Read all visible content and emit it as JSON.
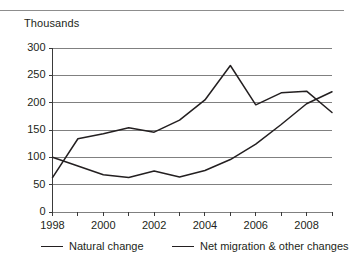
{
  "chart_data": {
    "type": "line",
    "title": "",
    "subtitle": "",
    "axis_note": "Thousands",
    "xlabel": "",
    "ylabel": "Thousands",
    "x": [
      1998,
      1999,
      2000,
      2001,
      2002,
      2003,
      2004,
      2005,
      2006,
      2007,
      2008,
      2009
    ],
    "xlim": [
      1998,
      2009
    ],
    "ylim": [
      0,
      300
    ],
    "ytick_labels": [
      "0",
      "50",
      "100",
      "150",
      "200",
      "250",
      "300"
    ],
    "ytick_values": [
      0,
      50,
      100,
      150,
      200,
      250,
      300
    ],
    "xtick_labels": [
      "1998",
      "2000",
      "2002",
      "2004",
      "2006",
      "2008"
    ],
    "xtick_values": [
      1998,
      2000,
      2002,
      2004,
      2006,
      2008
    ],
    "grid": "horizontal",
    "legend_position": "bottom",
    "line_color": "#231f20",
    "grid_color": "#808080",
    "series": [
      {
        "name": "Natural change",
        "values": [
          100,
          84,
          68,
          63,
          75,
          64,
          76,
          96,
          124,
          160,
          198,
          220
        ]
      },
      {
        "name": "Net migration & other changes",
        "values": [
          63,
          134,
          143,
          154,
          146,
          168,
          205,
          268,
          196,
          218,
          221,
          182
        ]
      }
    ]
  },
  "legend": {
    "items": [
      {
        "label": "Natural change"
      },
      {
        "label": "Net migration & other changes"
      }
    ]
  },
  "yticks": [
    {
      "label": "300"
    },
    {
      "label": "250"
    },
    {
      "label": "200"
    },
    {
      "label": "150"
    },
    {
      "label": "100"
    },
    {
      "label": "50"
    },
    {
      "label": "0"
    }
  ],
  "xticks": [
    {
      "label": "1998"
    },
    {
      "label": "2000"
    },
    {
      "label": "2002"
    },
    {
      "label": "2004"
    },
    {
      "label": "2006"
    },
    {
      "label": "2008"
    }
  ]
}
